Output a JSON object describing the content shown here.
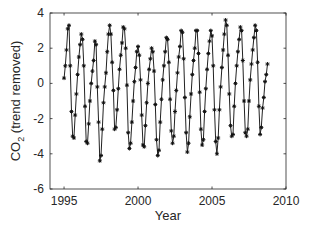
{
  "chart_data": {
    "type": "line",
    "title": "",
    "xlabel": "Year",
    "ylabel": "CO2 (trend removed)",
    "ylabel_main": "CO",
    "ylabel_sub": "2",
    "ylabel_rest": " (trend removed)",
    "xlim": [
      1994.05,
      2010
    ],
    "ylim": [
      -6,
      4
    ],
    "xticks": [
      1995,
      2000,
      2005,
      2010
    ],
    "xtick_labels": [
      "1995",
      "2000",
      "2005",
      "2010"
    ],
    "yticks": [
      -6,
      -4,
      -2,
      0,
      2,
      4
    ],
    "ytick_labels": [
      "-6",
      "-4",
      "-2",
      "0",
      "2",
      "4"
    ],
    "grid": false,
    "legend": null,
    "marker": "asterisk",
    "line_color": "#222222",
    "series": [
      {
        "name": "CO2 detrended (monthly)",
        "x_start": 1995.0,
        "x_step": 0.08333,
        "values": [
          0.3,
          1.0,
          1.9,
          3.1,
          3.3,
          1.0,
          -1.6,
          -3.0,
          -3.1,
          -1.8,
          -0.6,
          0.5,
          1.5,
          2.2,
          2.8,
          2.5,
          1.0,
          -1.3,
          -3.3,
          -3.4,
          -2.3,
          -1.0,
          0.0,
          0.7,
          1.3,
          2.4,
          2.2,
          -0.2,
          -2.2,
          -4.4,
          -4.1,
          -2.6,
          -1.1,
          -0.2,
          0.6,
          1.8,
          2.8,
          3.3,
          2.8,
          1.2,
          -0.4,
          -2.6,
          -2.5,
          -1.5,
          -0.3,
          0.8,
          1.6,
          2.3,
          3.2,
          3.1,
          2.0,
          -0.1,
          -2.8,
          -3.7,
          -3.4,
          -2.2,
          -1.0,
          0.1,
          0.9,
          1.8,
          2.1,
          1.6,
          0.2,
          -1.8,
          -3.5,
          -3.6,
          -2.4,
          -1.1,
          0.0,
          0.8,
          1.4,
          2.0,
          1.8,
          0.7,
          -1.2,
          -3.2,
          -4.1,
          -3.8,
          -2.2,
          -0.9,
          0.2,
          1.0,
          1.8,
          2.6,
          2.5,
          1.2,
          -0.9,
          -2.7,
          -3.4,
          -3.0,
          -1.6,
          -0.4,
          0.6,
          1.5,
          2.1,
          3.0,
          2.9,
          1.4,
          -0.8,
          -2.8,
          -3.9,
          -3.4,
          -1.9,
          -0.6,
          0.5,
          1.3,
          2.0,
          3.0,
          3.0,
          1.7,
          -0.5,
          -2.6,
          -3.5,
          -3.2,
          -1.6,
          -0.3,
          0.8,
          1.7,
          2.4,
          3.0,
          2.7,
          1.0,
          -1.5,
          -3.3,
          -4.0,
          -3.1,
          -1.5,
          -0.2,
          0.9,
          1.9,
          2.8,
          3.6,
          3.3,
          1.6,
          -0.6,
          -2.4,
          -3.0,
          -2.9,
          -1.3,
          0.0,
          1.0,
          1.8,
          2.5,
          3.2,
          3.0,
          1.3,
          -1.0,
          -2.8,
          -3.0,
          -2.6,
          -1.0,
          0.2,
          1.1,
          1.9,
          2.6,
          3.3,
          3.0,
          1.2,
          -1.3,
          -2.9,
          -2.5,
          -1.4,
          -0.8,
          0.1,
          0.5,
          1.1
        ]
      }
    ]
  }
}
